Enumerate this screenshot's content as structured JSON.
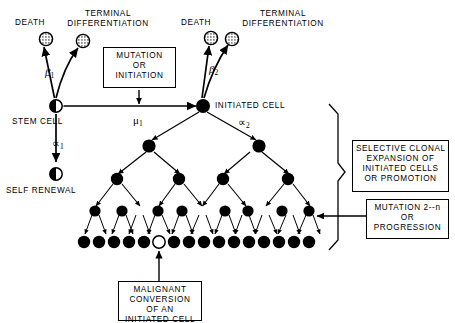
{
  "diagram": {
    "type": "flow-diagram",
    "labels": {
      "death_left": "DEATH",
      "terminal_diff_left": "TERMINAL\nDIFFERENTIATION",
      "death_right": "DEATH",
      "terminal_diff_right": "TERMINAL\nDIFFERENTIATION",
      "stem_cell": "STEM CELL",
      "self_renewal": "SELF RENEWAL",
      "initiated_cell": "INITIATED CELL"
    },
    "rate_symbols": {
      "beta1": "β",
      "beta1_sub": "1",
      "beta2": "β",
      "beta2_sub": "2",
      "mu1": "μ",
      "mu1_sub": "1",
      "alpha1": "∝",
      "alpha1_sub": "1",
      "alpha2": "∝",
      "alpha2_sub": "2"
    },
    "boxes": [
      {
        "id": "mutation-initiation",
        "lines": [
          "MUTATION",
          "OR",
          "INITIATION"
        ],
        "text": "MUTATION\nOR\nINITIATION"
      },
      {
        "id": "selective-clonal-expansion",
        "lines": [
          "SELECTIVE CLONAL",
          "EXPANSION OF",
          "INITIATED CELLS",
          "OR PROMOTION"
        ],
        "text": "SELECTIVE CLONAL\nEXPANSION OF\nINITIATED CELLS\nOR PROMOTION"
      },
      {
        "id": "mutation-progression",
        "lines": [
          "MUTATION 2--n",
          "OR",
          "PROGRESSION"
        ],
        "text": "MUTATION 2--n\nOR\nPROGRESSION"
      },
      {
        "id": "malignant-conversion",
        "lines": [
          "MALIGNANT",
          "CONVERSION",
          "OF AN",
          "INITIATED CELL"
        ],
        "text": "MALIGNANT\nCONVERSION\nOF AN\nINITIATED CELL"
      }
    ],
    "colors": {
      "ink": "#000000",
      "paper": "#ffffff"
    },
    "cells": {
      "stem_cell_style": "half-filled-circle",
      "self_renewal_style": "half-filled-circle",
      "death_style": "stippled-circle",
      "terminal_differentiation_style": "stippled-circle",
      "initiated_cell_style": "filled-circle",
      "malignant_cell_style": "open-circle",
      "tree_levels": [
        1,
        2,
        4,
        8,
        16
      ],
      "malignant_index_in_bottom_row": 6,
      "bottom_row_count": 16
    }
  }
}
